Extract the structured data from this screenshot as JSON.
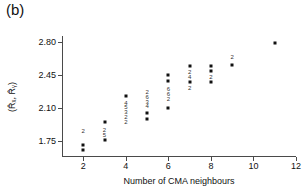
{
  "panel": {
    "label": "(b)"
  },
  "chart_data": {
    "type": "scatter",
    "title": "",
    "subtitle": "",
    "xlabel": "Number of CMA neighbours",
    "ylabel": "(R̂ₓ, R̂ᵧ)",
    "xlim": [
      1,
      12
    ],
    "ylim": [
      1.58,
      2.86
    ],
    "xticks": [
      2,
      4,
      6,
      8,
      10,
      12
    ],
    "xtick_labels": [
      "2",
      "4",
      "6",
      "8",
      "10",
      "12"
    ],
    "yticks": [
      1.75,
      2.1,
      2.45,
      2.8
    ],
    "ytick_labels": [
      "1.75",
      "2.10",
      "2.45",
      "2.80"
    ],
    "grid": false,
    "legend": null,
    "marker": "filled-square",
    "marker_color": "#111111",
    "axis_color": "#4a4a4a",
    "points": [
      {
        "x": 2,
        "y": 1.71,
        "label": ""
      },
      {
        "x": 2,
        "y": 1.655,
        "label": ""
      },
      {
        "x": 3,
        "y": 1.955,
        "label": ""
      },
      {
        "x": 3,
        "y": 1.765,
        "label": ""
      },
      {
        "x": 4,
        "y": 2.225,
        "label": ""
      },
      {
        "x": 5,
        "y": 2.045,
        "label": ""
      },
      {
        "x": 5,
        "y": 1.985,
        "label": ""
      },
      {
        "x": 6,
        "y": 2.445,
        "label": ""
      },
      {
        "x": 6,
        "y": 2.385,
        "label": ""
      },
      {
        "x": 6,
        "y": 2.1,
        "label": ""
      },
      {
        "x": 7,
        "y": 2.545,
        "label": ""
      },
      {
        "x": 7,
        "y": 2.375,
        "label": ""
      },
      {
        "x": 8,
        "y": 2.545,
        "label": ""
      },
      {
        "x": 8,
        "y": 2.485,
        "label": ""
      },
      {
        "x": 8,
        "y": 2.375,
        "label": ""
      },
      {
        "x": 9,
        "y": 2.555,
        "label": ""
      },
      {
        "x": 11,
        "y": 2.785,
        "label": ""
      }
    ],
    "multiplicity_labels": [
      {
        "x": 2,
        "y": 1.855,
        "text": "2"
      },
      {
        "x": 3,
        "y": 1.865,
        "text": "2"
      },
      {
        "x": 3,
        "y": 1.815,
        "text": "5"
      },
      {
        "x": 4,
        "y": 2.155,
        "text": "4"
      },
      {
        "x": 4,
        "y": 2.105,
        "text": "5"
      },
      {
        "x": 4,
        "y": 2.055,
        "text": "3"
      },
      {
        "x": 4,
        "y": 2.005,
        "text": "2"
      },
      {
        "x": 4,
        "y": 1.955,
        "text": "2"
      },
      {
        "x": 5,
        "y": 2.265,
        "text": "2"
      },
      {
        "x": 5,
        "y": 2.215,
        "text": "6"
      },
      {
        "x": 5,
        "y": 2.165,
        "text": "3"
      },
      {
        "x": 5,
        "y": 2.115,
        "text": "4"
      },
      {
        "x": 6,
        "y": 2.295,
        "text": "6"
      },
      {
        "x": 6,
        "y": 2.245,
        "text": "6"
      },
      {
        "x": 6,
        "y": 2.195,
        "text": "2"
      },
      {
        "x": 7,
        "y": 2.475,
        "text": "2"
      },
      {
        "x": 7,
        "y": 2.425,
        "text": "4"
      },
      {
        "x": 7,
        "y": 2.315,
        "text": "2"
      },
      {
        "x": 8,
        "y": 2.425,
        "text": "2"
      },
      {
        "x": 9,
        "y": 2.635,
        "text": "2"
      }
    ]
  }
}
